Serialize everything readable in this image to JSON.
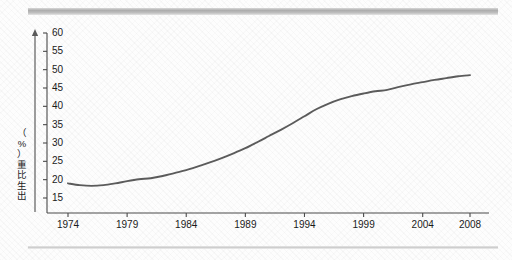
{
  "figure": {
    "background_color": "#fdfdfd",
    "rule_top_color": "#a9a9a9",
    "rule_bottom_color": "#c9c9c9",
    "axis_color": "#4a4a4a",
    "line_color": "#5b5b5b"
  },
  "chart_data": {
    "type": "line",
    "title": "",
    "xlabel": "",
    "ylabel": "出生比重（%）",
    "ylabel_chars": [
      "出",
      "生",
      "比",
      "重",
      "（",
      "%",
      "）"
    ],
    "xlim": [
      1974,
      2008
    ],
    "ylim": [
      15,
      60
    ],
    "ytick_values": [
      15,
      20,
      25,
      30,
      35,
      40,
      45,
      50,
      55,
      60
    ],
    "ytick_labels": [
      "15",
      "20",
      "25",
      "30",
      "35",
      "40",
      "45",
      "50",
      "55",
      "60"
    ],
    "xtick_values": [
      1974,
      1979,
      1984,
      1989,
      1994,
      1999,
      2004,
      2008
    ],
    "xtick_labels": [
      "1974",
      "1979",
      "1984",
      "1989",
      "1994",
      "1999",
      "2004",
      "2008"
    ],
    "grid": false,
    "legend": null,
    "series": [
      {
        "name": "出生比重",
        "x": [
          1974,
          1975,
          1976,
          1977,
          1978,
          1979,
          1980,
          1981,
          1982,
          1983,
          1984,
          1985,
          1986,
          1987,
          1988,
          1989,
          1990,
          1991,
          1992,
          1993,
          1994,
          1995,
          1996,
          1997,
          1998,
          1999,
          2000,
          2001,
          2002,
          2003,
          2004,
          2005,
          2006,
          2007,
          2008
        ],
        "values": [
          19.0,
          18.5,
          18.3,
          18.5,
          19.0,
          19.6,
          20.1,
          20.4,
          21.0,
          21.8,
          22.6,
          23.6,
          24.7,
          25.9,
          27.2,
          28.6,
          30.2,
          31.9,
          33.6,
          35.4,
          37.3,
          39.2,
          40.7,
          41.9,
          42.8,
          43.5,
          44.1,
          44.5,
          45.3,
          46.0,
          46.6,
          47.2,
          47.7,
          48.2,
          48.5
        ]
      }
    ]
  }
}
